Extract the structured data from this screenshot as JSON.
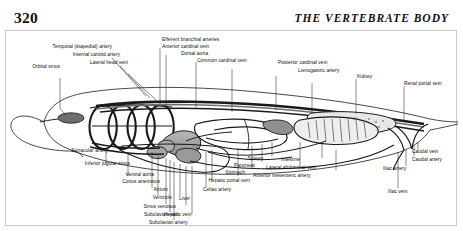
{
  "page": {
    "folio": "320",
    "running_head": "THE VERTEBRATE BODY"
  },
  "figure": {
    "name": "shark-circulatory-system-lateral-diagram",
    "ink_color": "#1a1a1a",
    "fill_gray": "#9a9a9a",
    "leader_color": "#2b2b2b"
  },
  "labels": {
    "orbital_sinus": "Orbital sinus",
    "temporal_stapedial_artery": "Temporal (stapedial) artery",
    "internal_carotid_artery": "Internal carotid artery",
    "lateral_head_vein": "Lateral head vein",
    "efferent_branchial_arteries": "Efferent branchial arteries",
    "anterior_cardinal_vein": "Anterior cardinal vein",
    "dorsal_aorta": "Dorsal aorta",
    "common_cardinal_vein": "Common cardinal vein",
    "posterior_cardinal_vein": "Posterior cardinal vein",
    "lienogastric_artery": "Lienogastric artery",
    "kidney": "Kidney",
    "renal_portal_vein": "Renal portal vein",
    "spiracular_artery": "Spiracular artery",
    "inferior_jugular_sinus": "Inferior jugular sinus",
    "ventral_aorta": "Ventral aorta",
    "conus_arteriosus": "Conus arteriosus",
    "atrium": "Atrium",
    "ventricle": "Ventricle",
    "sinus_venosus": "Sinus venosus",
    "subclavian_vein": "Subclavian vein",
    "subclavian_artery": "Subclavian artery",
    "hepatic_vein": "Hepatic vein",
    "liver": "Liver",
    "celiac_artery": "Celiac artery",
    "hepatic_portal_vein": "Hepatic portal vein",
    "stomach": "Stomach",
    "pancreas": "Pancreas",
    "spleen": "Spleen",
    "intestine": "Intestine",
    "lateral_abdominal_vein": "Lateral abdominal vein",
    "anterior_mesenteric_artery": "Anterior mesenteric artery",
    "iliac_vein": "Iliac vein",
    "iliac_artery": "Iliac artery",
    "caudal_artery": "Caudal artery",
    "caudal_vein": "Caudal vein"
  }
}
